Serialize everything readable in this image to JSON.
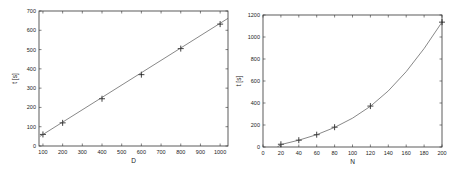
{
  "chart_data": [
    {
      "type": "line",
      "title": "",
      "xlabel": "D",
      "ylabel": "t [s]",
      "xlim": [
        80,
        1040
      ],
      "ylim": [
        0,
        700
      ],
      "xticks": [
        100,
        200,
        300,
        400,
        500,
        600,
        700,
        800,
        900,
        1000
      ],
      "yticks": [
        0,
        100,
        200,
        300,
        400,
        500,
        600,
        700
      ],
      "grid": false,
      "series": [
        {
          "name": "measured",
          "style": "markers-plus",
          "x": [
            100,
            200,
            400,
            600,
            800,
            1000
          ],
          "y": [
            60,
            120,
            245,
            370,
            505,
            632
          ]
        },
        {
          "name": "fit",
          "style": "line",
          "x": [
            85,
            1040
          ],
          "y": [
            50,
            662
          ]
        }
      ]
    },
    {
      "type": "line",
      "title": "",
      "xlabel": "N",
      "ylabel": "t [s]",
      "xlim": [
        0,
        200
      ],
      "ylim": [
        0,
        1200
      ],
      "xticks": [
        0,
        20,
        40,
        60,
        80,
        100,
        120,
        140,
        160,
        180,
        200
      ],
      "yticks": [
        0,
        200,
        400,
        600,
        800,
        1000,
        1200
      ],
      "grid": false,
      "series": [
        {
          "name": "measured",
          "style": "markers-plus",
          "x": [
            20,
            40,
            60,
            80,
            120,
            200
          ],
          "y": [
            25,
            62,
            112,
            180,
            372,
            1135
          ]
        },
        {
          "name": "fit",
          "style": "curve",
          "x": [
            16,
            20,
            40,
            60,
            80,
            100,
            120,
            140,
            160,
            180,
            200
          ],
          "y": [
            0,
            22,
            62,
            112,
            178,
            262,
            370,
            510,
            685,
            895,
            1135
          ]
        }
      ]
    }
  ],
  "frames": [
    {
      "left": 39,
      "top": 11,
      "right": 228,
      "bottom": 146
    },
    {
      "left": 263,
      "top": 15,
      "right": 442,
      "bottom": 147
    }
  ]
}
